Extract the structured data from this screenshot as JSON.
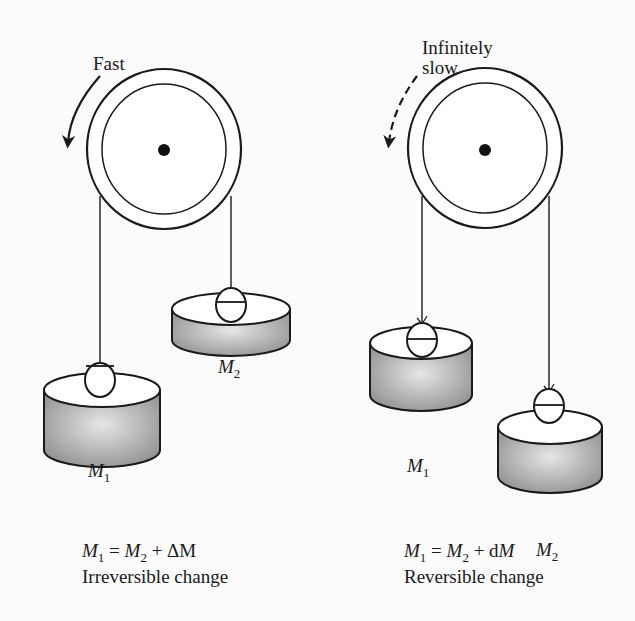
{
  "figure": {
    "left_panel": {
      "rotation_label": "Fast",
      "rotation_arrow_style": "solid",
      "mass_left_label": "M",
      "mass_left_sub": "1",
      "mass_right_label": "M",
      "mass_right_sub": "2",
      "equation": {
        "lhs": "M",
        "lhs_sub": "1",
        "op": " = ",
        "rhs": "M",
        "rhs_sub": "2",
        "plus": " + ",
        "delta": "ΔM"
      },
      "caption": "Irreversible change"
    },
    "right_panel": {
      "rotation_label_line1": "Infinitely",
      "rotation_label_line2": "slow",
      "rotation_arrow_style": "dashed",
      "mass_left_label": "M",
      "mass_left_sub": "1",
      "mass_right_label": "M",
      "mass_right_sub": "2",
      "equation": {
        "lhs": "M",
        "lhs_sub": "1",
        "op": " = ",
        "rhs": "M",
        "rhs_sub": "2",
        "plus": " + ",
        "d": "d",
        "dM": "M"
      },
      "caption": "Reversible change"
    },
    "colors": {
      "stroke": "#1a1a1a",
      "weight_fill_light": "#e6e6e6",
      "weight_fill_dark": "#8e8e8e",
      "background": "#fbfbfb"
    }
  }
}
